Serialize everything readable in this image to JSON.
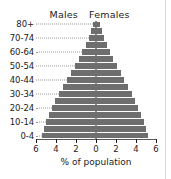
{
  "headers": {
    "males": "Males",
    "females": "Females"
  },
  "axis": {
    "x_title": "% of population",
    "x_ticks": [
      "6",
      "4",
      "2",
      "0",
      "2",
      "4",
      "6"
    ],
    "y_visible_labels": [
      "80+",
      "70-74",
      "60-64",
      "50-54",
      "40-44",
      "30-34",
      "20-24",
      "10-14",
      "0-4"
    ]
  },
  "colors": {
    "bar": "#6e6e6e",
    "axis": "#1b1b1b",
    "leader": "#9a9a9a",
    "background": "#ffffff",
    "border": "#d8d8d8"
  },
  "chart_data": {
    "type": "bar",
    "title": "",
    "subtitle": "",
    "xlabel": "% of population",
    "ylabel": "",
    "xlim": [
      -6,
      6
    ],
    "xticks": [
      -6,
      -4,
      -2,
      0,
      2,
      4,
      6
    ],
    "xticklabels": [
      "6",
      "4",
      "2",
      "0",
      "2",
      "4",
      "6"
    ],
    "grid": false,
    "legend_position": "top",
    "orientation": "horizontal",
    "layout": "population-pyramid",
    "categories": [
      "0-4",
      "5-9",
      "10-14",
      "15-19",
      "20-24",
      "25-29",
      "30-34",
      "35-39",
      "40-44",
      "45-49",
      "50-54",
      "55-59",
      "60-64",
      "65-69",
      "70-74",
      "75-79",
      "80+"
    ],
    "series": [
      {
        "name": "Males",
        "direction": "left",
        "values": [
          5.4,
          5.2,
          5.0,
          4.7,
          4.4,
          4.1,
          3.7,
          3.3,
          2.9,
          2.5,
          2.1,
          1.7,
          1.4,
          1.05,
          0.75,
          0.5,
          0.3
        ]
      },
      {
        "name": "Females",
        "direction": "right",
        "values": [
          5.2,
          5.0,
          4.8,
          4.5,
          4.2,
          3.9,
          3.6,
          3.2,
          2.8,
          2.45,
          2.05,
          1.7,
          1.4,
          1.1,
          0.8,
          0.55,
          0.4
        ]
      }
    ]
  }
}
